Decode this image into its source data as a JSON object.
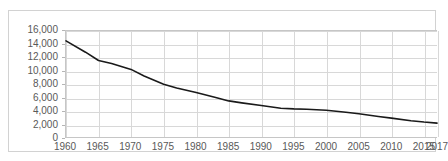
{
  "header": {
    "clipped_text_left": "",
    "clipped_text_right": ""
  },
  "chart_data": {
    "type": "line",
    "title": "",
    "subtitle": "",
    "xlabel": "",
    "ylabel": "",
    "grid": true,
    "legend": false,
    "legend_position": "none",
    "line_color": "#1a1a1a",
    "grid_color": "#d8d8d8",
    "axis_label_color": "#595959",
    "frame_color": "#d2d2d2",
    "xlim": [
      1960,
      2017
    ],
    "ylim": [
      0,
      16000
    ],
    "x_ticks": [
      1960,
      1965,
      1970,
      1975,
      1980,
      1985,
      1990,
      1995,
      2000,
      2005,
      2010,
      2015,
      2017
    ],
    "x_tick_labels": [
      "1960",
      "1965",
      "1970",
      "1975",
      "1980",
      "1985",
      "1990",
      "1995",
      "2000",
      "2005",
      "2010",
      "2015",
      "2017"
    ],
    "y_ticks": [
      0,
      2000,
      4000,
      6000,
      8000,
      10000,
      12000,
      14000,
      16000
    ],
    "y_tick_labels": [
      "0",
      "2,000",
      "4,000",
      "6,000",
      "8,000",
      "10,000",
      "12,000",
      "14,000",
      "16,000"
    ],
    "series": [
      {
        "name": "series-1",
        "x": [
          1960,
          1963,
          1965,
          1967,
          1970,
          1972,
          1975,
          1977,
          1980,
          1983,
          1985,
          1987,
          1990,
          1993,
          1995,
          1997,
          2000,
          2003,
          2005,
          2008,
          2010,
          2013,
          2015,
          2017
        ],
        "values": [
          14500,
          12800,
          11550,
          11100,
          10200,
          9200,
          7950,
          7400,
          6700,
          5950,
          5450,
          5150,
          4750,
          4350,
          4250,
          4200,
          4050,
          3750,
          3500,
          3100,
          2850,
          2450,
          2250,
          2100
        ]
      }
    ]
  }
}
